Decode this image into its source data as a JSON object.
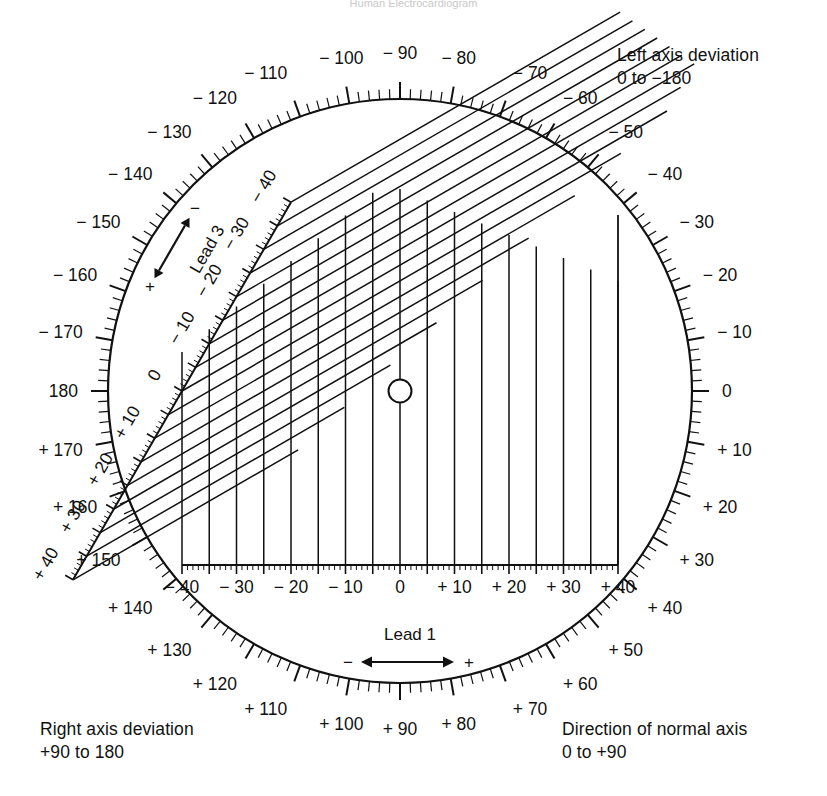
{
  "header": {
    "title": "Human Electrocardiogram"
  },
  "notes": {
    "left_axis": {
      "title": "Left axis deviation",
      "range": "0 to −180"
    },
    "right_axis": {
      "title": "Right axis deviation",
      "range": "+90 to 180"
    },
    "normal_axis": {
      "title": "Direction of normal axis",
      "range": "0 to +90"
    }
  },
  "leads": {
    "lead1": {
      "label": "Lead 1",
      "neg": "−",
      "pos": "+"
    },
    "lead3": {
      "label": "Lead 3",
      "neg": "−",
      "pos": "+"
    }
  },
  "chart_data": {
    "type": "scatter",
    "xlabel": "Lead 1",
    "ylabel": "Lead 3",
    "xlim": [
      -40,
      40
    ],
    "ylim": [
      -40,
      40
    ],
    "grid": true,
    "legend": "none",
    "lead1_axis": {
      "orientation_deg": 0,
      "tick_major_step": 5,
      "tick_minor_step": 1,
      "labels": [
        "− 40",
        "− 30",
        "− 20",
        "− 10",
        "0",
        "+ 10",
        "+ 20",
        "+ 30",
        "+ 40"
      ],
      "values": [
        -40,
        -30,
        -20,
        -10,
        0,
        10,
        20,
        30,
        40
      ]
    },
    "lead3_axis": {
      "orientation_deg": 120,
      "tick_major_step": 5,
      "tick_minor_step": 1,
      "labels": [
        "− 40",
        "− 30",
        "− 20",
        "− 10",
        "0",
        "+ 10",
        "+ 20",
        "+ 30",
        "+ 40"
      ],
      "values": [
        -40,
        -30,
        -20,
        -10,
        0,
        10,
        20,
        30,
        40
      ]
    },
    "protractor": {
      "tick_major_step_deg": 10,
      "tick_minor_step_deg": 2,
      "labels": [
        {
          "deg": 0,
          "text": "0"
        },
        {
          "deg": 10,
          "text": "+ 10"
        },
        {
          "deg": 20,
          "text": "+ 20"
        },
        {
          "deg": 30,
          "text": "+ 30"
        },
        {
          "deg": 40,
          "text": "+ 40"
        },
        {
          "deg": 50,
          "text": "+ 50"
        },
        {
          "deg": 60,
          "text": "+ 60"
        },
        {
          "deg": 70,
          "text": "+ 70"
        },
        {
          "deg": 80,
          "text": "+ 80"
        },
        {
          "deg": 90,
          "text": "+ 90"
        },
        {
          "deg": 100,
          "text": "+ 100"
        },
        {
          "deg": 110,
          "text": "+ 110"
        },
        {
          "deg": 120,
          "text": "+ 120"
        },
        {
          "deg": 130,
          "text": "+ 130"
        },
        {
          "deg": 140,
          "text": "+ 140"
        },
        {
          "deg": 150,
          "text": "+ 150"
        },
        {
          "deg": 160,
          "text": "+ 160"
        },
        {
          "deg": 170,
          "text": "+ 170"
        },
        {
          "deg": 180,
          "text": "180"
        },
        {
          "deg": -170,
          "text": "− 170"
        },
        {
          "deg": -160,
          "text": "− 160"
        },
        {
          "deg": -150,
          "text": "− 150"
        },
        {
          "deg": -140,
          "text": "− 140"
        },
        {
          "deg": -130,
          "text": "− 130"
        },
        {
          "deg": -120,
          "text": "− 120"
        },
        {
          "deg": -110,
          "text": "− 110"
        },
        {
          "deg": -100,
          "text": "− 100"
        },
        {
          "deg": -90,
          "text": "− 90"
        },
        {
          "deg": -80,
          "text": "− 80"
        },
        {
          "deg": -70,
          "text": "− 70"
        },
        {
          "deg": -60,
          "text": "− 60"
        },
        {
          "deg": -50,
          "text": "− 50"
        },
        {
          "deg": -40,
          "text": "− 40"
        },
        {
          "deg": -30,
          "text": "− 30"
        },
        {
          "deg": -20,
          "text": "− 20"
        },
        {
          "deg": -10,
          "text": "− 10"
        }
      ]
    },
    "origin_marker": {
      "shape": "circle",
      "x": 0,
      "y": 0
    }
  },
  "colors": {
    "ink": "#111111",
    "paper": "#ffffff"
  }
}
